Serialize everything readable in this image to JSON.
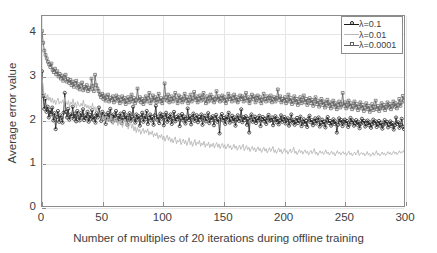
{
  "chart_data": {
    "type": "line",
    "title": "",
    "xlabel": "Number of multiples of 20 iterations during offline training",
    "ylabel": "Average error value",
    "xlim": [
      0,
      300
    ],
    "ylim": [
      0,
      4.4
    ],
    "xticks": [
      0,
      50,
      100,
      150,
      200,
      250,
      300
    ],
    "yticks": [
      0,
      1,
      2,
      3,
      4
    ],
    "grid": true,
    "legend_position": "top-right",
    "series": [
      {
        "name": "λ=0.1",
        "color": "#1a1a1a",
        "marker": "circle",
        "x_step": 1,
        "values": [
          3.12,
          2.55,
          2.25,
          2.48,
          2.18,
          2.3,
          2.05,
          2.22,
          2.12,
          2.28,
          1.98,
          2.15,
          1.78,
          2.06,
          2.2,
          1.95,
          2.1,
          2.04,
          1.93,
          2.16,
          2.62,
          2.18,
          2.05,
          2.25,
          2.0,
          2.12,
          2.08,
          2.3,
          2.02,
          2.14,
          1.96,
          2.2,
          2.06,
          1.98,
          2.15,
          2.05,
          2.24,
          1.99,
          2.1,
          2.03,
          2.18,
          1.95,
          2.11,
          2.02,
          2.22,
          2.0,
          2.08,
          1.93,
          2.15,
          2.05,
          2.28,
          2.1,
          1.97,
          2.18,
          2.02,
          2.12,
          1.9,
          2.06,
          2.16,
          2.0,
          2.25,
          2.08,
          1.95,
          2.12,
          2.03,
          2.2,
          1.98,
          2.09,
          2.01,
          2.14,
          1.92,
          2.05,
          2.18,
          2.0,
          2.1,
          1.88,
          2.04,
          2.15,
          1.97,
          2.07,
          2.3,
          2.02,
          1.93,
          2.12,
          2.0,
          2.08,
          1.86,
          2.05,
          2.16,
          1.95,
          2.09,
          2.01,
          2.2,
          1.9,
          2.04,
          2.12,
          1.98,
          2.06,
          1.88,
          2.1,
          2.32,
          2.0,
          2.07,
          1.92,
          2.14,
          2.02,
          2.11,
          1.87,
          2.05,
          2.16,
          1.95,
          2.08,
          2.0,
          2.12,
          1.9,
          2.03,
          2.18,
          1.96,
          2.06,
          2.01,
          2.1,
          1.85,
          2.04,
          2.13,
          1.98,
          2.07,
          1.91,
          2.02,
          2.26,
          1.99,
          2.08,
          1.89,
          2.05,
          2.14,
          1.97,
          2.03,
          2.1,
          1.94,
          2.06,
          2.0,
          2.12,
          1.88,
          2.04,
          2.09,
          1.96,
          2.02,
          2.15,
          1.92,
          2.05,
          1.99,
          2.08,
          1.87,
          2.03,
          2.11,
          1.95,
          2.01,
          1.68,
          2.06,
          2.13,
          1.98,
          2.04,
          1.9,
          2.07,
          2.0,
          2.16,
          1.93,
          2.02,
          2.09,
          1.96,
          2.05,
          1.86,
          2.01,
          2.1,
          1.97,
          2.03,
          2.24,
          1.94,
          2.06,
          1.99,
          2.08,
          1.88,
          2.02,
          1.7,
          2.05,
          2.12,
          1.95,
          2.0,
          2.07,
          1.92,
          2.03,
          1.98,
          2.09,
          1.85,
          2.01,
          2.06,
          1.96,
          2.02,
          1.9,
          2.04,
          2.11,
          1.97,
          1.99,
          2.05,
          1.87,
          2.0,
          2.08,
          1.94,
          2.02,
          1.89,
          1.98,
          2.1,
          1.95,
          2.01,
          2.06,
          1.91,
          1.99,
          2.03,
          1.86,
          1.97,
          2.12,
          1.93,
          2.0,
          1.88,
          1.96,
          2.04,
          1.92,
          1.98,
          2.07,
          1.85,
          1.95,
          2.01,
          1.9,
          1.97,
          1.83,
          2.02,
          2.09,
          1.94,
          1.99,
          1.87,
          1.96,
          2.03,
          1.91,
          1.98,
          2.05,
          1.84,
          1.93,
          2.0,
          1.89,
          1.95,
          1.82,
          1.99,
          2.06,
          1.92,
          1.97,
          1.86,
          1.94,
          2.01,
          1.9,
          1.96,
          1.7,
          1.88,
          2.03,
          1.93,
          1.99,
          1.85,
          1.95,
          2.0,
          1.91,
          1.97,
          1.83,
          1.89,
          2.04,
          1.94,
          1.98,
          1.86,
          1.92,
          1.99,
          1.88,
          1.95,
          1.8,
          1.9,
          2.02,
          1.93,
          1.97,
          1.84,
          1.91,
          1.98,
          1.87,
          1.94,
          1.81,
          1.89,
          2.0,
          1.92,
          1.96,
          1.83,
          1.9,
          1.97,
          1.86,
          1.93,
          1.79,
          1.88,
          1.99,
          1.91,
          1.95,
          1.82,
          1.89,
          1.96,
          1.85,
          1.92,
          1.77,
          1.87,
          2.05,
          1.9,
          1.94,
          1.81,
          1.88,
          2.02,
          1.84,
          1.78
        ]
      },
      {
        "name": "λ=0.01",
        "color": "#b8b8b8",
        "marker": "none",
        "x_step": 1,
        "values": [
          3.0,
          2.72,
          2.55,
          2.62,
          2.48,
          2.58,
          2.44,
          2.52,
          2.4,
          2.5,
          2.38,
          2.46,
          2.35,
          2.44,
          2.5,
          2.36,
          2.42,
          2.38,
          2.46,
          2.34,
          2.52,
          2.4,
          2.35,
          2.44,
          2.3,
          2.41,
          2.36,
          2.48,
          2.32,
          2.4,
          2.28,
          2.42,
          2.34,
          2.3,
          2.38,
          2.31,
          2.45,
          2.29,
          2.36,
          2.27,
          2.34,
          2.24,
          2.32,
          2.26,
          2.38,
          2.22,
          2.3,
          2.18,
          2.28,
          2.2,
          2.12,
          2.05,
          1.98,
          2.1,
          2.0,
          2.08,
          1.92,
          2.02,
          2.06,
          1.95,
          2.1,
          2.0,
          1.88,
          2.04,
          1.94,
          2.06,
          1.86,
          1.96,
          1.9,
          1.99,
          1.82,
          1.92,
          2.0,
          1.85,
          1.94,
          1.78,
          1.88,
          1.96,
          1.8,
          1.9,
          1.74,
          1.84,
          1.7,
          1.82,
          1.72,
          1.78,
          1.66,
          1.74,
          1.8,
          1.68,
          1.76,
          1.7,
          1.79,
          1.64,
          1.72,
          1.66,
          1.74,
          1.6,
          1.68,
          1.62,
          1.7,
          1.56,
          1.64,
          1.58,
          1.66,
          1.54,
          1.62,
          1.5,
          1.58,
          1.64,
          1.52,
          1.6,
          1.48,
          1.56,
          1.46,
          1.54,
          1.6,
          1.44,
          1.52,
          1.48,
          1.56,
          1.42,
          1.5,
          1.55,
          1.44,
          1.52,
          1.4,
          1.48,
          1.58,
          1.42,
          1.5,
          1.38,
          1.46,
          1.54,
          1.4,
          1.48,
          1.44,
          1.52,
          1.38,
          1.46,
          1.41,
          1.5,
          1.36,
          1.44,
          1.4,
          1.48,
          1.35,
          1.43,
          1.38,
          1.46,
          1.34,
          1.42,
          1.47,
          1.36,
          1.44,
          1.33,
          1.4,
          1.45,
          1.35,
          1.42,
          1.32,
          1.38,
          1.44,
          1.34,
          1.4,
          1.3,
          1.36,
          1.43,
          1.33,
          1.39,
          1.29,
          1.35,
          1.41,
          1.31,
          1.37,
          1.43,
          1.28,
          1.34,
          1.4,
          1.3,
          1.36,
          1.26,
          1.33,
          1.38,
          1.29,
          1.35,
          1.25,
          1.32,
          1.37,
          1.28,
          1.34,
          1.24,
          1.3,
          1.36,
          1.27,
          1.33,
          1.23,
          1.29,
          1.35,
          1.26,
          1.32,
          1.38,
          1.24,
          1.3,
          1.22,
          1.28,
          1.34,
          1.25,
          1.31,
          1.21,
          1.27,
          1.33,
          1.24,
          1.29,
          1.2,
          1.26,
          1.32,
          1.23,
          1.28,
          1.36,
          1.22,
          1.27,
          1.19,
          1.25,
          1.31,
          1.23,
          1.28,
          1.2,
          1.26,
          1.3,
          1.22,
          1.27,
          1.18,
          1.24,
          1.29,
          1.21,
          1.26,
          1.33,
          1.2,
          1.25,
          1.17,
          1.23,
          1.28,
          1.22,
          1.26,
          1.19,
          1.24,
          1.3,
          1.21,
          1.25,
          1.18,
          1.23,
          1.27,
          1.2,
          1.24,
          1.16,
          1.22,
          1.28,
          1.21,
          1.25,
          1.18,
          1.23,
          1.26,
          1.2,
          1.24,
          1.17,
          1.22,
          1.27,
          1.19,
          1.23,
          1.16,
          1.21,
          1.25,
          1.18,
          1.22,
          1.3,
          1.17,
          1.21,
          1.24,
          1.19,
          1.23,
          1.16,
          1.2,
          1.26,
          1.18,
          1.22,
          1.15,
          1.19,
          1.24,
          1.17,
          1.21,
          1.28,
          1.18,
          1.22,
          1.16,
          1.2,
          1.25,
          1.19,
          1.23,
          1.17,
          1.21,
          1.26,
          1.2,
          1.24,
          1.18,
          1.22,
          1.27,
          1.21,
          1.25,
          1.19,
          1.23,
          1.28,
          1.22,
          1.26,
          1.24,
          1.3
        ]
      },
      {
        "name": "λ=0.0001",
        "color": "#5e5e5e",
        "marker": "square",
        "x_step": 1,
        "values": [
          4.05,
          3.78,
          3.6,
          3.5,
          3.42,
          3.34,
          3.28,
          3.22,
          3.3,
          3.15,
          3.1,
          3.18,
          3.05,
          3.12,
          3.0,
          3.06,
          2.95,
          3.02,
          2.9,
          2.98,
          3.04,
          2.88,
          2.94,
          2.85,
          2.92,
          2.8,
          2.88,
          2.76,
          2.84,
          2.9,
          2.74,
          2.82,
          2.7,
          2.78,
          2.86,
          2.68,
          2.76,
          2.72,
          2.8,
          2.66,
          2.74,
          2.7,
          2.95,
          2.78,
          2.66,
          3.04,
          2.8,
          2.72,
          2.66,
          2.58,
          2.52,
          2.6,
          2.48,
          2.56,
          2.44,
          2.52,
          2.58,
          2.42,
          2.5,
          2.46,
          2.54,
          2.4,
          2.48,
          2.56,
          2.44,
          2.52,
          2.38,
          2.46,
          2.54,
          2.42,
          2.5,
          2.36,
          2.44,
          2.52,
          2.4,
          2.48,
          2.58,
          2.42,
          2.5,
          2.38,
          2.46,
          2.72,
          2.44,
          2.52,
          2.4,
          2.48,
          2.36,
          2.44,
          2.54,
          2.42,
          2.5,
          2.62,
          2.38,
          2.46,
          2.56,
          2.44,
          2.52,
          2.4,
          2.48,
          2.6,
          2.42,
          2.5,
          2.38,
          2.46,
          2.84,
          2.52,
          2.44,
          2.58,
          2.4,
          2.48,
          2.54,
          2.42,
          2.5,
          2.62,
          2.46,
          2.38,
          2.56,
          2.44,
          2.52,
          2.4,
          2.48,
          2.6,
          2.44,
          2.52,
          2.38,
          2.46,
          2.58,
          2.42,
          2.5,
          2.64,
          2.46,
          2.54,
          2.4,
          2.48,
          2.56,
          2.44,
          2.52,
          2.62,
          2.46,
          2.38,
          2.54,
          2.42,
          2.5,
          2.58,
          2.44,
          2.52,
          2.4,
          2.48,
          2.66,
          2.46,
          2.54,
          2.42,
          2.5,
          2.56,
          2.44,
          2.52,
          2.38,
          2.46,
          2.6,
          2.48,
          2.54,
          2.42,
          2.5,
          2.58,
          2.44,
          2.52,
          2.4,
          2.46,
          2.56,
          2.48,
          2.54,
          2.42,
          2.5,
          2.62,
          2.44,
          2.52,
          2.38,
          2.46,
          2.58,
          2.48,
          2.54,
          2.4,
          2.5,
          2.56,
          2.44,
          2.52,
          2.38,
          2.46,
          2.6,
          2.48,
          2.42,
          2.54,
          2.5,
          2.44,
          2.56,
          2.4,
          2.48,
          2.52,
          2.42,
          2.5,
          2.7,
          2.46,
          2.54,
          2.4,
          2.48,
          2.44,
          2.52,
          2.38,
          2.46,
          2.58,
          2.42,
          2.5,
          2.36,
          2.44,
          2.54,
          2.4,
          2.48,
          2.34,
          2.42,
          2.52,
          2.38,
          2.46,
          2.56,
          2.4,
          2.48,
          2.34,
          2.44,
          2.5,
          2.38,
          2.46,
          2.32,
          2.42,
          2.52,
          2.36,
          2.44,
          2.3,
          2.4,
          2.48,
          2.34,
          2.42,
          2.28,
          2.38,
          2.46,
          2.32,
          2.4,
          2.26,
          2.36,
          2.44,
          2.3,
          2.38,
          2.24,
          2.34,
          2.42,
          2.28,
          2.36,
          2.62,
          2.32,
          2.4,
          2.26,
          2.34,
          2.44,
          2.3,
          2.38,
          2.24,
          2.32,
          2.42,
          2.28,
          2.36,
          2.22,
          2.3,
          2.4,
          2.26,
          2.34,
          2.2,
          2.28,
          2.38,
          2.24,
          2.32,
          2.18,
          2.26,
          2.36,
          2.22,
          2.3,
          2.44,
          2.24,
          2.32,
          2.2,
          2.28,
          2.38,
          2.26,
          2.34,
          2.22,
          2.3,
          2.4,
          2.28,
          2.36,
          2.24,
          2.32,
          2.42,
          2.3,
          2.38,
          2.26,
          2.34,
          2.48,
          2.32,
          2.4,
          2.55,
          2.44
        ]
      }
    ]
  },
  "legend": {
    "entries": [
      {
        "label": "λ=0.1"
      },
      {
        "label": "λ=0.01"
      },
      {
        "label": "λ=0.0001"
      }
    ]
  },
  "axes": {
    "x_tick_labels": [
      "0",
      "50",
      "100",
      "150",
      "200",
      "250",
      "300"
    ],
    "y_tick_labels": [
      "0",
      "1",
      "2",
      "3",
      "4"
    ],
    "x_title": "Number of multiples of 20 iterations during offline training",
    "y_title": "Average error value"
  }
}
